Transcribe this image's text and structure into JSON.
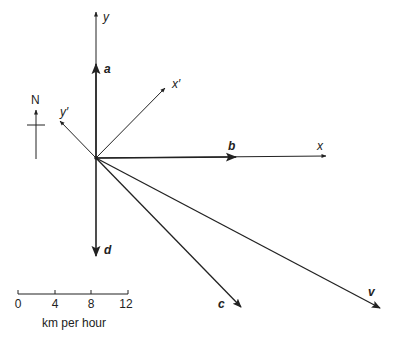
{
  "diagram": {
    "type": "vector-diagram",
    "colors": {
      "ink": "#222222",
      "background": "#ffffff"
    },
    "axes": {
      "y": "y",
      "x": "x",
      "x_prime": "x′",
      "y_prime": "y′"
    },
    "vectors": {
      "a": "a",
      "b": "b",
      "c": "c",
      "d": "d",
      "v": "v"
    },
    "compass": {
      "label": "N"
    },
    "scale_bar": {
      "ticks": [
        "0",
        "4",
        "8",
        "12"
      ],
      "unit_label": "km per hour"
    }
  }
}
